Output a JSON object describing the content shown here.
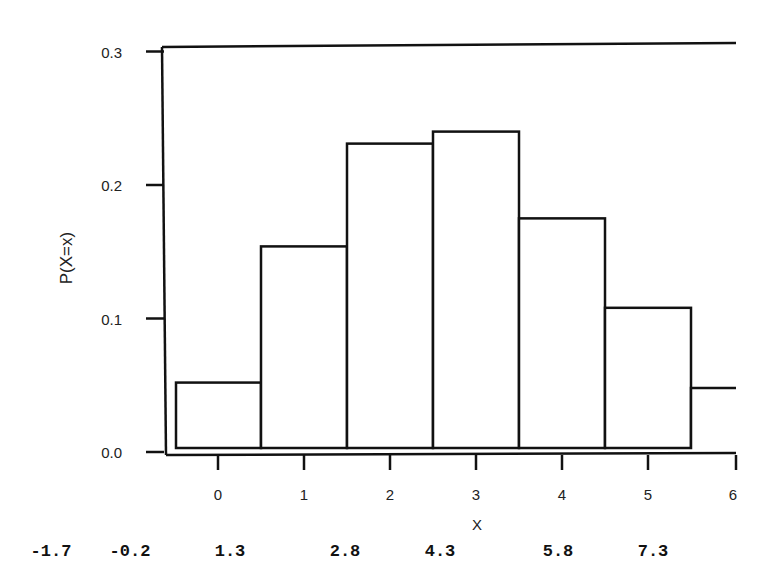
{
  "chart_data": {
    "type": "bar",
    "title": "",
    "xlabel": "X",
    "ylabel": "P(X=x)",
    "categories": [
      "0",
      "1",
      "2",
      "3",
      "4",
      "5",
      "6"
    ],
    "values": [
      0.052,
      0.154,
      0.231,
      0.24,
      0.175,
      0.108,
      0.048
    ],
    "ylim": [
      0.0,
      0.3
    ],
    "xlim": [
      -0.5,
      6
    ],
    "y_ticks": [
      "0.0",
      "0.1",
      "0.2",
      "0.3"
    ],
    "x_ticks": [
      "0",
      "1",
      "2",
      "3",
      "4",
      "5",
      "6"
    ],
    "secondary_x_labels": [
      "-1.7",
      "-0.2",
      "1.3",
      "2.8",
      "4.3",
      "5.8",
      "7.3"
    ],
    "grid": false,
    "legend": null,
    "bar_style": {
      "fill": "#ffffff",
      "stroke": "#111111"
    }
  }
}
